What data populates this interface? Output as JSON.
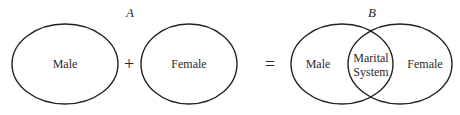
{
  "diagram": {
    "panel_a": {
      "label": "A",
      "left_circle": "Male",
      "operator": "+",
      "right_circle": "Female"
    },
    "equals": "=",
    "panel_b": {
      "label": "B",
      "left_region": "Male",
      "overlap_line1": "Marital",
      "overlap_line2": "System",
      "right_region": "Female"
    }
  },
  "colors": {
    "stroke": "#222222",
    "text": "#2a2a2a",
    "background": "#ffffff"
  }
}
